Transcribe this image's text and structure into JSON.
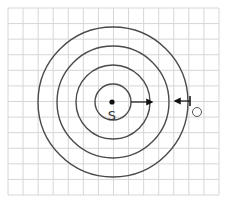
{
  "diagram": {
    "labels": {
      "source": "S",
      "observer": "O"
    },
    "grid": {
      "x0": 8,
      "y0": 8,
      "x1": 219,
      "y1": 195,
      "cols": 14,
      "rows": 12,
      "color": "#d6d6d6"
    },
    "center": {
      "x": 113,
      "y": 102
    },
    "wavefront_radii": [
      18,
      37,
      56,
      75
    ],
    "colors": {
      "wave": "#4a4a4a",
      "ink": "#111111"
    },
    "arrows": [
      {
        "name": "source-arrow",
        "x1": 131,
        "y1": 102,
        "x2": 152,
        "y2": 102,
        "direction": "right"
      },
      {
        "name": "observer-arrow",
        "x1": 190,
        "y1": 101,
        "x2": 175,
        "y2": 101,
        "direction": "left"
      }
    ],
    "observer_marker": {
      "x": 197,
      "y": 112,
      "r": 4.5
    }
  }
}
